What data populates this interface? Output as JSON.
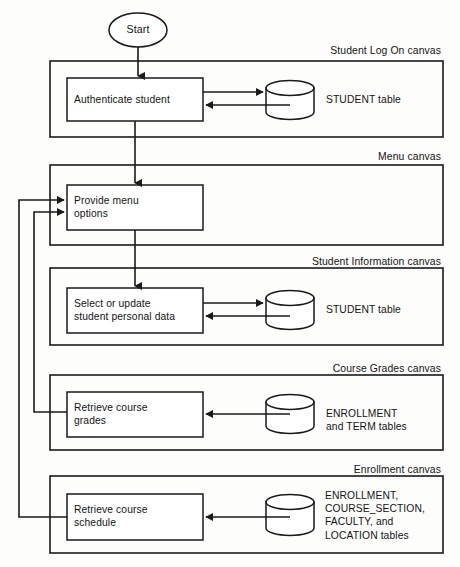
{
  "diagram": {
    "start_node": {
      "label": "Start",
      "shape": "ellipse"
    },
    "canvases": [
      {
        "id": "student-log-on",
        "label": "Student Log On canvas",
        "process": {
          "label": "Authenticate student"
        },
        "datastore": {
          "label": "STUDENT table",
          "shape": "cylinder"
        },
        "arrows": [
          "process-to-store",
          "store-to-process"
        ]
      },
      {
        "id": "menu",
        "label": "Menu canvas",
        "process": {
          "label": "Provide menu\noptions"
        },
        "datastore": null,
        "arrows": [
          "inbound-from-authenticate",
          "feedback-from-grades",
          "feedback-from-schedule"
        ]
      },
      {
        "id": "student-information",
        "label": "Student Information canvas",
        "process": {
          "label": "Select or update\nstudent personal data"
        },
        "datastore": {
          "label": "STUDENT table",
          "shape": "cylinder"
        },
        "arrows": [
          "process-to-store",
          "store-to-process"
        ]
      },
      {
        "id": "course-grades",
        "label": "Course Grades canvas",
        "process": {
          "label": "Retrieve course\ngrades"
        },
        "datastore": {
          "label": "ENROLLMENT\nand TERM tables",
          "shape": "cylinder"
        },
        "arrows": [
          "store-to-process"
        ]
      },
      {
        "id": "enrollment",
        "label": "Enrollment canvas",
        "process": {
          "label": "Retrieve course\nschedule"
        },
        "datastore": {
          "label": "ENROLLMENT,\nCOURSE_SECTION,\nFACULTY, and\nLOCATION tables",
          "shape": "cylinder"
        },
        "arrows": [
          "store-to-process"
        ]
      }
    ],
    "colors": {
      "stroke": "#1a1a1a",
      "background": "#fdfdfc",
      "text": "#141414",
      "fill": "#ffffff"
    }
  }
}
